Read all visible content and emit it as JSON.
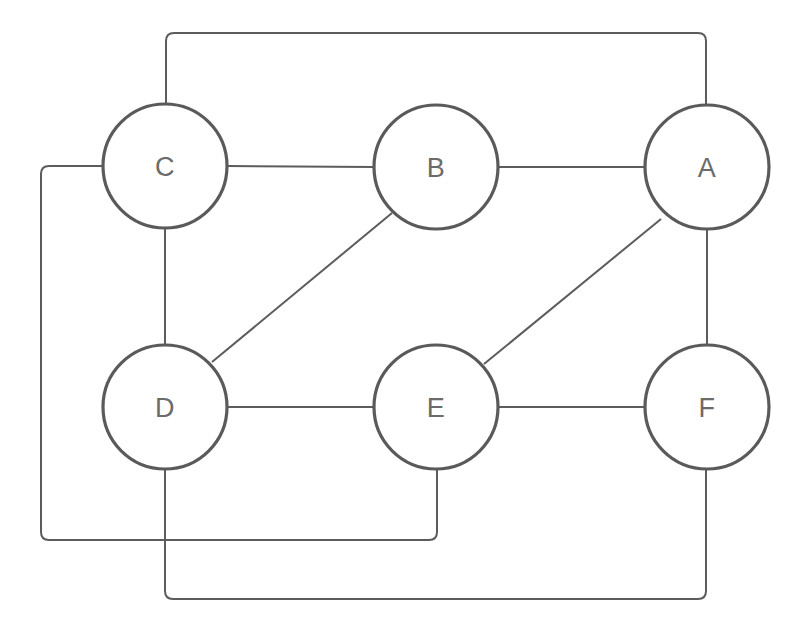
{
  "diagram": {
    "type": "node-link-graph",
    "width": 803,
    "height": 626,
    "background_color": "#ffffff",
    "node_stroke_color": "#5a5a5a",
    "node_fill_color": "#ffffff",
    "edge_color": "#5c5c5c",
    "label_color": "#6b6b6b",
    "node_radius": 62,
    "nodes": [
      {
        "id": "A",
        "label": "A",
        "cx": 707,
        "cy": 167
      },
      {
        "id": "B",
        "label": "B",
        "cx": 436,
        "cy": 167
      },
      {
        "id": "C",
        "label": "C",
        "cx": 165,
        "cy": 166
      },
      {
        "id": "D",
        "label": "D",
        "cx": 165,
        "cy": 407
      },
      {
        "id": "E",
        "label": "E",
        "cx": 436,
        "cy": 407
      },
      {
        "id": "F",
        "label": "F",
        "cx": 707,
        "cy": 407
      }
    ],
    "edges": [
      {
        "id": "edge-c-b",
        "from": "C",
        "to": "B",
        "style": "straight",
        "path": "M 227 166 L 374 167"
      },
      {
        "id": "edge-b-a",
        "from": "B",
        "to": "A",
        "style": "straight",
        "path": "M 498 167 L 645 167"
      },
      {
        "id": "edge-c-d",
        "from": "C",
        "to": "D",
        "style": "straight",
        "path": "M 165 228 L 165 345"
      },
      {
        "id": "edge-a-f",
        "from": "A",
        "to": "F",
        "style": "straight",
        "path": "M 707 229 L 707 345"
      },
      {
        "id": "edge-d-e",
        "from": "D",
        "to": "E",
        "style": "straight",
        "path": "M 227 407 L 374 407"
      },
      {
        "id": "edge-e-f",
        "from": "E",
        "to": "F",
        "style": "straight",
        "path": "M 498 407 L 645 407"
      },
      {
        "id": "edge-d-b",
        "from": "D",
        "to": "B",
        "style": "diagonal",
        "path": "M 212 362 L 392 213"
      },
      {
        "id": "edge-e-a",
        "from": "E",
        "to": "A",
        "style": "diagonal",
        "path": "M 484 364 L 661 219"
      },
      {
        "id": "edge-c-a",
        "from": "C",
        "to": "A",
        "style": "routed-top",
        "path": "M 166 104 L 166 41 Q 166 33 174 33 L 698 33 Q 706 33 706 41 L 706 105"
      },
      {
        "id": "edge-c-e",
        "from": "C",
        "to": "E",
        "style": "routed-left-bottom",
        "path": "M 103 166 L 49 166 Q 41 166 41 174 L 41 532 Q 41 540 49 540 L 429 540 Q 437 540 437 532 L 437 469"
      },
      {
        "id": "edge-d-f",
        "from": "D",
        "to": "F",
        "style": "routed-bottom",
        "path": "M 165 469 L 165 591 Q 165 599 173 599 L 698 599 Q 706 599 706 591 L 706 469"
      }
    ]
  }
}
